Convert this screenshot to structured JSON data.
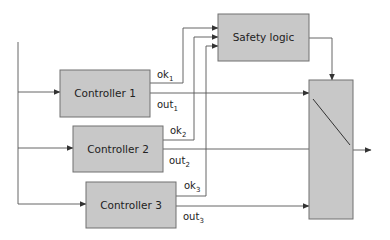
{
  "diagram": {
    "blocks": [
      {
        "id": "controller-1",
        "label": "Controller 1"
      },
      {
        "id": "controller-2",
        "label": "Controller 2"
      },
      {
        "id": "controller-3",
        "label": "Controller 3"
      },
      {
        "id": "safety-logic",
        "label": "Safety logic"
      },
      {
        "id": "switch",
        "label": ""
      }
    ],
    "signals": [
      {
        "id": "ok1",
        "base": "ok",
        "sub": "1"
      },
      {
        "id": "out1",
        "base": "out",
        "sub": "1"
      },
      {
        "id": "ok2",
        "base": "ok",
        "sub": "2"
      },
      {
        "id": "out2",
        "base": "out",
        "sub": "2"
      },
      {
        "id": "ok3",
        "base": "ok",
        "sub": "3"
      },
      {
        "id": "out3",
        "base": "out",
        "sub": "3"
      }
    ],
    "connections": [
      {
        "from": "input",
        "to": "controller-1"
      },
      {
        "from": "input",
        "to": "controller-2"
      },
      {
        "from": "input",
        "to": "controller-3"
      },
      {
        "from": "controller-1",
        "to": "safety-logic",
        "signal": "ok1"
      },
      {
        "from": "controller-2",
        "to": "safety-logic",
        "signal": "ok2"
      },
      {
        "from": "controller-3",
        "to": "safety-logic",
        "signal": "ok3"
      },
      {
        "from": "controller-1",
        "to": "switch",
        "signal": "out1"
      },
      {
        "from": "controller-2",
        "to": "switch",
        "signal": "out2"
      },
      {
        "from": "controller-3",
        "to": "switch",
        "signal": "out3"
      },
      {
        "from": "safety-logic",
        "to": "switch"
      },
      {
        "from": "switch",
        "to": "output"
      }
    ],
    "colors": {
      "block_fill": "#c8c8c8",
      "block_stroke": "#707070",
      "wire": "#555555"
    }
  }
}
